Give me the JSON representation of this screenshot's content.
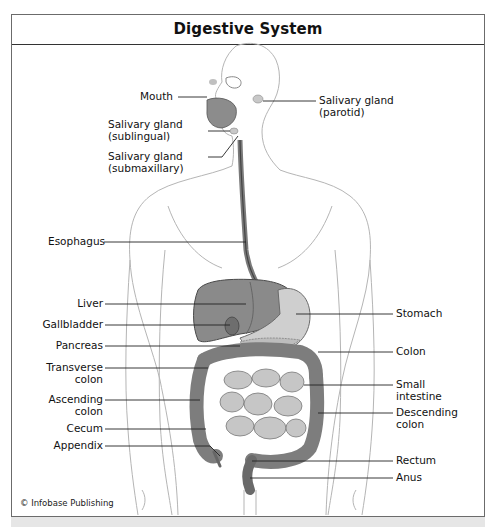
{
  "title": "Digestive System",
  "credit": "© Infobase Publishing",
  "labels_left": [
    {
      "id": "mouth",
      "lines": [
        "Mouth"
      ]
    },
    {
      "id": "salivary-sublingual",
      "lines": [
        "Salivary gland",
        "(sublingual)"
      ]
    },
    {
      "id": "salivary-submaxillary",
      "lines": [
        "Salivary gland",
        "(submaxillary)"
      ]
    },
    {
      "id": "esophagus",
      "lines": [
        "Esophagus"
      ]
    },
    {
      "id": "liver",
      "lines": [
        "Liver"
      ]
    },
    {
      "id": "gallbladder",
      "lines": [
        "Gallbladder"
      ]
    },
    {
      "id": "pancreas",
      "lines": [
        "Pancreas"
      ]
    },
    {
      "id": "transverse-colon",
      "lines": [
        "Transverse",
        "colon"
      ]
    },
    {
      "id": "ascending-colon",
      "lines": [
        "Ascending",
        "colon"
      ]
    },
    {
      "id": "cecum",
      "lines": [
        "Cecum"
      ]
    },
    {
      "id": "appendix",
      "lines": [
        "Appendix"
      ]
    }
  ],
  "labels_right": [
    {
      "id": "salivary-parotid",
      "lines": [
        "Salivary gland",
        "(parotid)"
      ]
    },
    {
      "id": "stomach",
      "lines": [
        "Stomach"
      ]
    },
    {
      "id": "colon",
      "lines": [
        "Colon"
      ]
    },
    {
      "id": "small-intestine",
      "lines": [
        "Small",
        "intestine"
      ]
    },
    {
      "id": "descending-colon",
      "lines": [
        "Descending",
        "colon"
      ]
    },
    {
      "id": "rectum",
      "lines": [
        "Rectum"
      ]
    },
    {
      "id": "anus",
      "lines": [
        "Anus"
      ]
    }
  ],
  "colors": {
    "frame": "#6b6b6b",
    "organ_dark": "#6e6e6e",
    "organ_mid": "#9a9a9a",
    "organ_light": "#c8c8c8",
    "body_outline": "#b5b5b5",
    "leader": "#222222"
  }
}
